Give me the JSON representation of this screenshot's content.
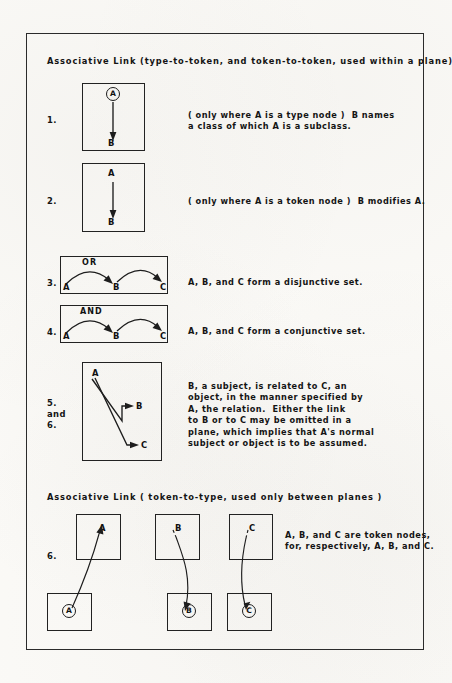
{
  "figure": {
    "section_one_heading": "Associative Link (type-to-token, and token-to-token, used within a plane)",
    "section_two_heading": "Associative Link ( token-to-type, used only between planes )",
    "items": [
      {
        "number": "1.",
        "description": "( only where A is a type node )  B names\na class of which A is a subclass.",
        "nodes": [
          "A",
          "B"
        ],
        "operator": ""
      },
      {
        "number": "2.",
        "description": "( only where A is a token node )  B modifies A.",
        "nodes": [
          "A",
          "B"
        ],
        "operator": ""
      },
      {
        "number": "3.",
        "description": "A, B, and C form a disjunctive set.",
        "nodes": [
          "A",
          "B",
          "C"
        ],
        "operator": "OR"
      },
      {
        "number": "4.",
        "description": "A, B, and C form a conjunctive set.",
        "nodes": [
          "A",
          "B",
          "C"
        ],
        "operator": "AND"
      },
      {
        "number": "5.\nand\n6.",
        "number_lines": [
          "5.",
          "and",
          "6."
        ],
        "description": "B, a subject, is related to C, an\nobject, in the manner specified by\nA, the relation.  Either the link\nto B or to C may be omitted in a\nplane, which implies that A's normal\nsubject or object is to be assumed.",
        "nodes": [
          "A",
          "B",
          "C"
        ],
        "operator": ""
      },
      {
        "number": "6.",
        "description": "A, B, and C are token nodes,\nfor, respectively, A, B, and C.",
        "nodes": [
          "A",
          "B",
          "C"
        ],
        "operator": ""
      }
    ],
    "labels": {
      "a": "A",
      "b": "B",
      "c": "C",
      "or": "OR",
      "and": "AND"
    },
    "colors": {
      "ink": "#1d1d1d",
      "paper": "#fbfaf7",
      "frame": "#2b2b2b"
    }
  }
}
